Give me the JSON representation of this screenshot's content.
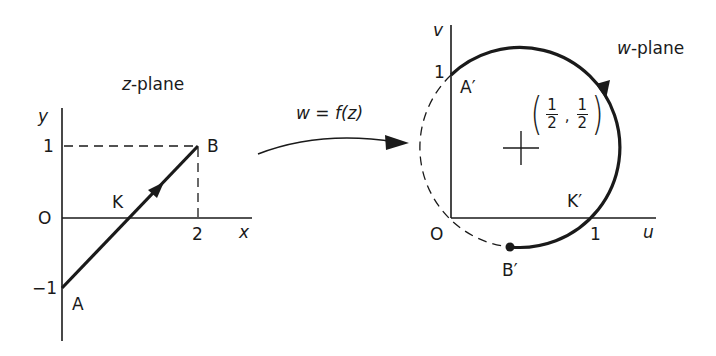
{
  "z_plane": {
    "title": "z-plane",
    "title_var": "z",
    "title_rest": "-plane",
    "axis_x_label": "x",
    "axis_y_label": "y",
    "origin_label": "O",
    "tick_x_2": "2",
    "tick_y_1": "1",
    "tick_y_neg1": "−1",
    "point_A": "A",
    "point_B": "B",
    "point_K": "K"
  },
  "mapping": {
    "label": "w = f(z)"
  },
  "w_plane": {
    "title_var": "w",
    "title_rest": "-plane",
    "axis_u_label": "u",
    "axis_v_label": "v",
    "origin_label": "O",
    "tick_u_1": "1",
    "tick_v_1": "1",
    "point_A": "A′",
    "point_B": "B′",
    "point_K": "K′",
    "center_num_1": "1",
    "center_den_1": "2",
    "center_num_2": "1",
    "center_den_2": "2",
    "center_open": "(",
    "center_close": ")",
    "center_comma": ","
  },
  "colors": {
    "ink": "#1a1a1a",
    "background": "#ffffff"
  }
}
